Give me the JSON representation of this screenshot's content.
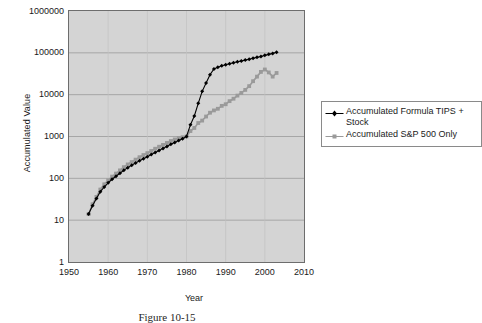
{
  "chart_data": {
    "type": "line",
    "title": "",
    "xlabel": "Year",
    "ylabel": "Accumulated Value",
    "yscale": "log",
    "xlim": [
      1950,
      2010
    ],
    "ylim": [
      1,
      1000000
    ],
    "grid": "horizontal",
    "legend_position": "right",
    "x_ticks": [
      "1950",
      "1960",
      "1970",
      "1980",
      "1990",
      "2000",
      "2010"
    ],
    "x_tick_values": [
      1950,
      1960,
      1970,
      1980,
      1990,
      2000,
      2010
    ],
    "y_ticks": [
      "1",
      "10",
      "100",
      "1000",
      "10000",
      "100000",
      "1000000"
    ],
    "y_tick_values": [
      1,
      10,
      100,
      1000,
      10000,
      100000,
      1000000
    ],
    "series": [
      {
        "name": "Accumulated Formula TIPS + Stock",
        "color": "#000000",
        "marker": "diamond",
        "x": [
          1955,
          1956,
          1957,
          1958,
          1959,
          1960,
          1961,
          1962,
          1963,
          1964,
          1965,
          1966,
          1967,
          1968,
          1969,
          1970,
          1971,
          1972,
          1973,
          1974,
          1975,
          1976,
          1977,
          1978,
          1979,
          1980,
          1981,
          1982,
          1983,
          1984,
          1985,
          1986,
          1987,
          1988,
          1989,
          1990,
          1991,
          1992,
          1993,
          1994,
          1995,
          1996,
          1997,
          1998,
          1999,
          2000,
          2001,
          2002,
          2003
        ],
        "y": [
          14,
          22,
          33,
          48,
          62,
          78,
          95,
          112,
          132,
          155,
          180,
          205,
          232,
          262,
          295,
          330,
          370,
          415,
          465,
          520,
          580,
          650,
          720,
          800,
          880,
          1000,
          1900,
          3100,
          6200,
          12000,
          19000,
          30000,
          41000,
          45000,
          49000,
          52000,
          55000,
          58000,
          61000,
          64000,
          67000,
          70000,
          74000,
          78000,
          82000,
          87000,
          92000,
          97000,
          103000
        ]
      },
      {
        "name": "Accumulated S&P 500 Only",
        "color": "#9a9a9a",
        "marker": "square",
        "x": [
          1955,
          1956,
          1957,
          1958,
          1959,
          1960,
          1961,
          1962,
          1963,
          1964,
          1965,
          1966,
          1967,
          1968,
          1969,
          1970,
          1971,
          1972,
          1973,
          1974,
          1975,
          1976,
          1977,
          1978,
          1979,
          1980,
          1981,
          1982,
          1983,
          1984,
          1985,
          1986,
          1987,
          1988,
          1989,
          1990,
          1991,
          1992,
          1993,
          1994,
          1995,
          1996,
          1997,
          1998,
          1999,
          2000,
          2001,
          2002,
          2003
        ],
        "y": [
          14,
          24,
          36,
          54,
          72,
          90,
          110,
          130,
          155,
          185,
          215,
          245,
          280,
          320,
          360,
          400,
          450,
          510,
          570,
          630,
          700,
          780,
          850,
          920,
          960,
          1000,
          1350,
          1600,
          2100,
          2400,
          3000,
          3700,
          4200,
          4600,
          5400,
          5900,
          7000,
          8000,
          9500,
          11000,
          13000,
          16000,
          21000,
          27000,
          35000,
          40000,
          34000,
          27000,
          33000
        ]
      }
    ]
  },
  "axes": {
    "y_title": "Accumulated Value",
    "x_title": "Year"
  },
  "legend": {
    "entries": [
      {
        "label": "Accumulated Formula TIPS + Stock",
        "marker": "black-diamond-line-marker"
      },
      {
        "label": "Accumulated S&P 500 Only",
        "marker": "gray-square-line-marker"
      }
    ]
  },
  "caption": {
    "text": "Figure 10-15"
  },
  "colors": {
    "plot_background": "#d4d4d4",
    "plot_border": "#6d6d6d",
    "gridline": "#9a9a9a",
    "series_1": "#000000",
    "series_2": "#9a9a9a",
    "page_background": "#ffffff"
  }
}
